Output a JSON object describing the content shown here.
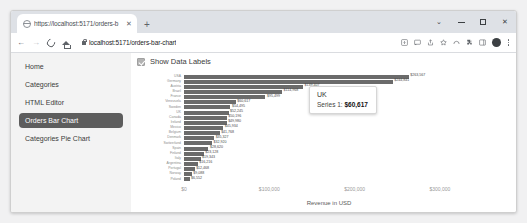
{
  "browser": {
    "tab": {
      "title": "https://localhost:5171/orders-b",
      "close_label": "✕",
      "favicon_name": "globe-icon"
    },
    "new_tab_label": "+",
    "window_controls": {
      "chevron_label": "⌄",
      "minimize_label": "",
      "maximize_label": "",
      "close_label": "✕"
    },
    "nav": {
      "back_label": "←",
      "forward_label": "→",
      "reload_label": "",
      "home_label": ""
    },
    "url": "localhost:5171/orders-bar-chart",
    "toolbar_icons": [
      "install-app-icon",
      "screencast-icon",
      "share-icon",
      "bookmark-star-icon",
      "extensions-arc-icon",
      "extensions-puzzle-icon",
      "sidepanel-icon",
      "profile-avatar-icon",
      "kebab-menu-icon"
    ]
  },
  "sidebar": {
    "items": [
      {
        "label": "Home",
        "active": false
      },
      {
        "label": "Categories",
        "active": false
      },
      {
        "label": "HTML Editor",
        "active": false
      },
      {
        "label": "Orders Bar Chart",
        "active": true
      },
      {
        "label": "Categories Pie Chart",
        "active": false
      }
    ],
    "active_bg": "#5d5d5d"
  },
  "controls": {
    "show_data_labels_label": "Show Data Labels",
    "show_data_labels_checked": true
  },
  "tooltip": {
    "title": "UK",
    "series_label": "Series 1:",
    "value": "$60,617"
  },
  "chart_data": {
    "type": "bar",
    "orientation": "horizontal",
    "title": "",
    "xlabel": "Revenue in USD",
    "ylabel": "",
    "xlim": [
      0,
      340000
    ],
    "xticks": [
      0,
      100000,
      200000,
      300000
    ],
    "xticklabels": [
      "$0",
      "$100,000",
      "$200,000",
      "$300,000"
    ],
    "grid": false,
    "legend": "none",
    "series_name": "Series 1",
    "bar_color": "#6b6b6b",
    "data_labels_shown": true,
    "categories": [
      "USA",
      "Germany",
      "Austria",
      "Brazil",
      "France",
      "Venezuela",
      "Sweden",
      "UK",
      "Canada",
      "Ireland",
      "Mexico",
      "Belgium",
      "Denmark",
      "Switzerland",
      "Spain",
      "Finland",
      "Italy",
      "Argentina",
      "Portugal",
      "Norway",
      "Poland"
    ],
    "values": [
      263567,
      244841,
      139407,
      114968,
      95499,
      60617,
      54495,
      52245,
      50196,
      49980,
      45934,
      41768,
      35327,
      32920,
      28620,
      23128,
      19343,
      16216,
      12468,
      9088,
      6552
    ],
    "value_labels": [
      "$263,567",
      "$244,841",
      "$139,407",
      "$114,968",
      "$95,499",
      "$60,617",
      "$54,495",
      "$52,245",
      "$50,196",
      "$49,980",
      "$45,934",
      "$41,768",
      "$35,327",
      "$32,920",
      "$28,620",
      "$23,128",
      "$19,343",
      "$16,216",
      "$12,468",
      "$9,088",
      "$6,552"
    ]
  }
}
